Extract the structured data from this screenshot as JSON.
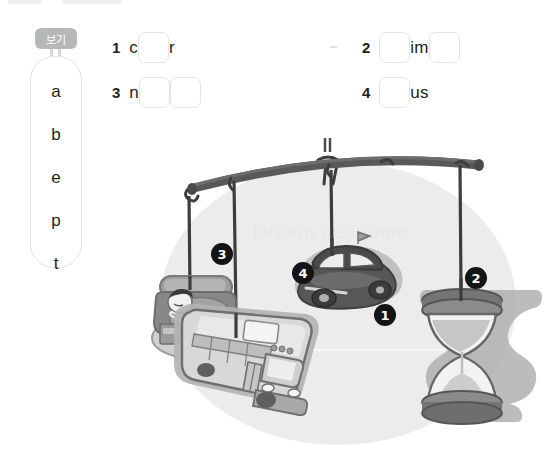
{
  "page": {
    "background_color": "#ffffff",
    "text_color": "#231f20"
  },
  "word_bank": {
    "tag_label": "보기",
    "tag_color": "#b6b7b9",
    "letters": [
      "a",
      "b",
      "e",
      "p",
      "t"
    ]
  },
  "quiz": {
    "items": [
      {
        "number": "1",
        "parts": [
          {
            "type": "text",
            "value": "c"
          },
          {
            "type": "blank",
            "value": ""
          },
          {
            "type": "text",
            "value": "r"
          }
        ]
      },
      {
        "number": "2",
        "parts": [
          {
            "type": "blank",
            "value": ""
          },
          {
            "type": "text",
            "value": "im"
          },
          {
            "type": "blank",
            "value": ""
          }
        ]
      },
      {
        "number": "3",
        "parts": [
          {
            "type": "text",
            "value": "n"
          },
          {
            "type": "blank",
            "value": ""
          },
          {
            "type": "blank",
            "value": ""
          }
        ]
      },
      {
        "number": "4",
        "parts": [
          {
            "type": "blank",
            "value": ""
          },
          {
            "type": "text",
            "value": "us"
          }
        ]
      }
    ]
  },
  "illustration": {
    "description": "mobile-with-hanging-objects",
    "watermark_text": "Dream gearjumo",
    "background_blob_color": "#ececec",
    "bar_color": "#4f4f4f",
    "badges": [
      {
        "label": "1",
        "target": "car",
        "x": 237,
        "y": 177
      },
      {
        "label": "2",
        "target": "hourglass",
        "x": 328,
        "y": 140
      },
      {
        "label": "3",
        "target": "nap",
        "x": 74,
        "y": 116
      },
      {
        "label": "4",
        "target": "bus",
        "x": 155,
        "y": 135
      }
    ],
    "objects": [
      {
        "name": "sofa-nap-scene",
        "number": "3"
      },
      {
        "name": "school-bus",
        "number": "4"
      },
      {
        "name": "car",
        "number": "1"
      },
      {
        "name": "hourglass",
        "number": "2"
      }
    ]
  }
}
